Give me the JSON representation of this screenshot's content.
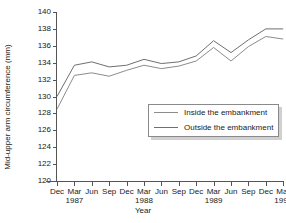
{
  "chart_data": {
    "type": "line",
    "title": "",
    "xlabel": "Year",
    "ylabel": "Mid-upper arm circumference (mm)",
    "ylim": [
      120,
      140
    ],
    "yticks": [
      120,
      122,
      124,
      126,
      128,
      130,
      132,
      134,
      136,
      138,
      140
    ],
    "grid": false,
    "legend_position": "center-right",
    "categories": [
      "Dec",
      "Mar",
      "Jun",
      "Sep",
      "Dec",
      "Mar",
      "Jun",
      "Sep",
      "Dec",
      "Mar",
      "Jun",
      "Sep",
      "Dec",
      "Mar"
    ],
    "year_labels": [
      "",
      "1987",
      "",
      "",
      "",
      "1988",
      "",
      "",
      "",
      "1989",
      "",
      "",
      "",
      "1990"
    ],
    "series": [
      {
        "name": "Inside the embankment",
        "color": "#8c8c8c",
        "values": [
          128.5,
          132.5,
          132.8,
          132.4,
          133.1,
          133.7,
          133.3,
          133.6,
          134.2,
          135.8,
          134.2,
          135.9,
          137.1,
          136.8
        ]
      },
      {
        "name": "Outside the embankment",
        "color": "#6f6f6f",
        "values": [
          130.0,
          133.7,
          134.1,
          133.5,
          133.7,
          134.4,
          133.9,
          134.1,
          134.8,
          136.6,
          135.2,
          136.7,
          138.0,
          138.0
        ]
      }
    ]
  },
  "axes": {
    "y_title": "Mid-upper arm circumference (mm)",
    "x_title": "Year"
  },
  "legend": {
    "items": [
      {
        "label": "Inside the embankment"
      },
      {
        "label": "Outside the embankment"
      }
    ]
  }
}
